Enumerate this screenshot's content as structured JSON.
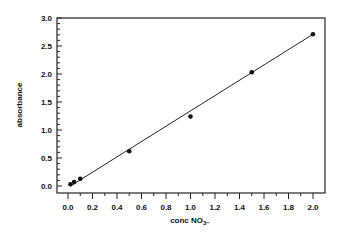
{
  "chart_data": {
    "type": "scatter",
    "title": "",
    "xlabel": "conc NO3-",
    "xlabel_main": "conc NO",
    "xlabel_sub": "3",
    "ylabel": "absorbance",
    "xlim": [
      -0.08,
      2.07
    ],
    "ylim": [
      -0.1,
      3.0
    ],
    "x_ticks": [
      "0.0",
      "0.2",
      "0.4",
      "0.6",
      "0.8",
      "1.0",
      "1.2",
      "1.4",
      "1.6",
      "1.8",
      "2.0"
    ],
    "y_ticks": [
      "0.0",
      "0.5",
      "1.0",
      "1.5",
      "2.0",
      "2.5",
      "3.0"
    ],
    "grid": false,
    "legend": "none",
    "series": [
      {
        "name": "measured",
        "style": "markers",
        "points": [
          {
            "x": 0.02,
            "y": 0.03
          },
          {
            "x": 0.05,
            "y": 0.07
          },
          {
            "x": 0.1,
            "y": 0.13
          },
          {
            "x": 0.5,
            "y": 0.62
          },
          {
            "x": 1.0,
            "y": 1.24
          },
          {
            "x": 1.5,
            "y": 2.03
          },
          {
            "x": 2.0,
            "y": 2.71
          }
        ]
      },
      {
        "name": "linear fit",
        "style": "line",
        "points": [
          {
            "x": 0.02,
            "y": 0.0
          },
          {
            "x": 2.0,
            "y": 2.71
          }
        ]
      }
    ]
  }
}
